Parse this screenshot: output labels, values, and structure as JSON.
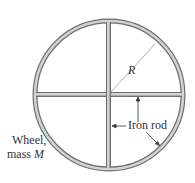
{
  "diagram": {
    "type": "wheel-with-cross-spokes",
    "labels": {
      "radius": "R",
      "rod": "Iron rod",
      "wheel_line1": "Wheel,",
      "wheel_line2_prefix": "mass ",
      "wheel_line2_var": "M"
    },
    "colors": {
      "rod_fill": "#c8c8c8",
      "rod_edge": "#6e6e6e",
      "arrow": "#333333",
      "radius_line": "#9a9a9a",
      "text": "#333333"
    },
    "geometry": {
      "center": [
        109,
        95
      ],
      "radius": 74
    }
  }
}
